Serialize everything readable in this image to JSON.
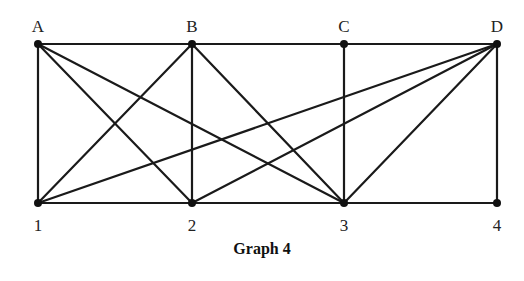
{
  "caption": "Graph 4",
  "colors": {
    "edge": "#1a1a1a",
    "vertex": "#111111",
    "label": "#222222",
    "background": "#ffffff"
  },
  "vertices": [
    {
      "id": "A",
      "label": "A",
      "x": 38,
      "y": 44,
      "label_x": 38,
      "label_y": 32
    },
    {
      "id": "B",
      "label": "B",
      "x": 192,
      "y": 44,
      "label_x": 192,
      "label_y": 32
    },
    {
      "id": "C",
      "label": "C",
      "x": 344,
      "y": 44,
      "label_x": 344,
      "label_y": 32
    },
    {
      "id": "D",
      "label": "D",
      "x": 497,
      "y": 44,
      "label_x": 497,
      "label_y": 32
    },
    {
      "id": "1",
      "label": "1",
      "x": 38,
      "y": 203,
      "label_x": 38,
      "label_y": 231
    },
    {
      "id": "2",
      "label": "2",
      "x": 192,
      "y": 203,
      "label_x": 192,
      "label_y": 231
    },
    {
      "id": "3",
      "label": "3",
      "x": 344,
      "y": 203,
      "label_x": 344,
      "label_y": 231
    },
    {
      "id": "4",
      "label": "4",
      "x": 497,
      "y": 203,
      "label_x": 497,
      "label_y": 231
    }
  ],
  "edges": [
    [
      "A",
      "B"
    ],
    [
      "B",
      "C"
    ],
    [
      "C",
      "D"
    ],
    [
      "1",
      "2"
    ],
    [
      "2",
      "3"
    ],
    [
      "3",
      "4"
    ],
    [
      "A",
      "1"
    ],
    [
      "B",
      "2"
    ],
    [
      "C",
      "3"
    ],
    [
      "D",
      "4"
    ],
    [
      "A",
      "2"
    ],
    [
      "A",
      "3"
    ],
    [
      "B",
      "1"
    ],
    [
      "B",
      "3"
    ],
    [
      "D",
      "1"
    ],
    [
      "D",
      "2"
    ],
    [
      "D",
      "3"
    ]
  ]
}
